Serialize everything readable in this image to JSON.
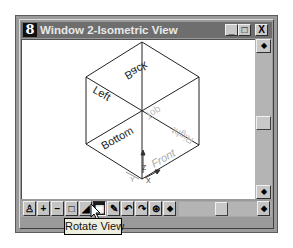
{
  "window": {
    "title": "Window 2-Isometric View",
    "app_icon_glyph": "8",
    "controls": {
      "minimize_glyph": "_",
      "maximize_glyph": "□",
      "close_glyph": "X"
    }
  },
  "view": {
    "face_labels": {
      "back": "Back",
      "left": "Left",
      "top": "Top",
      "right": "Right",
      "bottom": "Bottom",
      "front": "Front"
    },
    "axis_labels": {
      "x": "X",
      "y": "Y",
      "z": "Z"
    }
  },
  "toolbar": {
    "tools": [
      {
        "name": "print",
        "glyph": "♙"
      },
      {
        "name": "zoom-in",
        "glyph": "+"
      },
      {
        "name": "zoom-out",
        "glyph": "−"
      },
      {
        "name": "window-area",
        "glyph": "□"
      },
      {
        "name": "fit-view",
        "glyph": "◢"
      },
      {
        "name": "rotate-view",
        "glyph": "▦",
        "active": true
      },
      {
        "name": "pan-view",
        "glyph": "✎"
      },
      {
        "name": "view-previous",
        "glyph": "↶"
      },
      {
        "name": "view-next",
        "glyph": "↷"
      },
      {
        "name": "view-attributes",
        "glyph": "⊛"
      },
      {
        "name": "scroll-left",
        "glyph": "◆"
      }
    ],
    "scroll_right_glyph": "◆"
  },
  "scrollbar": {
    "up_glyph": "◆",
    "down_glyph": "◆"
  },
  "tooltip": {
    "text": "Rotate View"
  },
  "colors": {
    "titlebar": "#6e6e6e",
    "frame": "#9a9a9a",
    "canvas": "#ffffff",
    "tooltip_bg": "#efefdf"
  }
}
